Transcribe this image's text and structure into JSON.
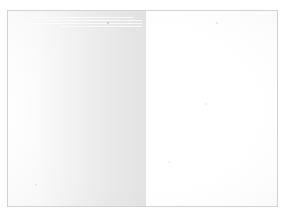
{
  "document": {
    "kind": "blank-page-scan",
    "canvas": {
      "width": 288,
      "height": 218
    },
    "page_background": "#ffffff",
    "frame": {
      "border_color": "#d2d2d2",
      "left": 7,
      "top": 10,
      "width": 271,
      "height": 197
    },
    "left_page": {
      "label": "",
      "gutter_shadow_from": "#ffffff",
      "gutter_shadow_to": "#e3e3e3",
      "width": 138
    },
    "right_page": {
      "label": "",
      "fill": "#ffffff",
      "width": 131
    },
    "streaks": [
      {
        "left": 22,
        "top": 6,
        "width": 104,
        "height": 1
      },
      {
        "left": 38,
        "top": 9,
        "width": 96,
        "height": 1
      },
      {
        "left": 16,
        "top": 12,
        "width": 118,
        "height": 1
      },
      {
        "left": 52,
        "top": 15,
        "width": 82,
        "height": 1
      }
    ],
    "specks": [
      {
        "left": 99,
        "top": 11,
        "size": 2,
        "color": "rgba(150,150,155,0.45)"
      },
      {
        "left": 208,
        "top": 11,
        "size": 2,
        "color": "rgba(170,170,175,0.30)"
      },
      {
        "left": 197,
        "top": 92,
        "size": 2,
        "color": "rgba(175,175,180,0.28)"
      },
      {
        "left": 27,
        "top": 173,
        "size": 2,
        "color": "rgba(175,175,180,0.30)"
      },
      {
        "left": 160,
        "top": 150,
        "size": 1.5,
        "color": "rgba(185,185,190,0.22)"
      }
    ]
  }
}
